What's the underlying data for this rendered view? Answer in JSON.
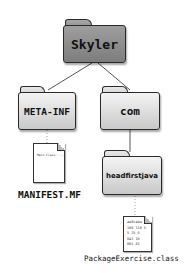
{
  "diagram": {
    "type": "directory-tree",
    "root": {
      "label": "Skyler",
      "kind": "folder",
      "children": [
        {
          "label": "META-INF",
          "kind": "folder",
          "children": [
            {
              "label": "MANIFEST.MF",
              "kind": "file",
              "content": "Main-Class: ..."
            }
          ]
        },
        {
          "label": "com",
          "kind": "folder",
          "children": [
            {
              "label": "headfirstjava",
              "kind": "folder",
              "children": [
                {
                  "label": "PackageExercise.class",
                  "kind": "file",
                  "content": "bytecode"
                }
              ]
            }
          ]
        }
      ]
    }
  },
  "labels": {
    "skyler": "Skyler",
    "meta_inf": "META-INF",
    "com": "com",
    "headfirstjava": "headfirstjava",
    "manifest": "MANIFEST.MF",
    "manifest_content": "Main-Class: ...",
    "package_exercise": "PackageExercise.class",
    "class_content": "ae8c4da\n100 110 5\n5 25 6\n043 10\n001 01"
  },
  "colors": {
    "root_folder": "#8e8e8e",
    "child_folder": "#dcdcdc",
    "line": "#555555"
  }
}
